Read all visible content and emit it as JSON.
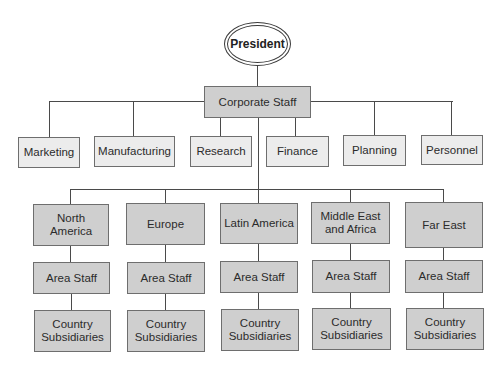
{
  "diagram": {
    "type": "org-chart",
    "root": {
      "label": "President"
    },
    "corporate": {
      "label": "Corporate Staff"
    },
    "functions": [
      {
        "label": "Marketing"
      },
      {
        "label": "Manufacturing"
      },
      {
        "label": "Research"
      },
      {
        "label": "Finance"
      },
      {
        "label": "Planning"
      },
      {
        "label": "Personnel"
      }
    ],
    "regions": [
      {
        "label": "North America",
        "area_staff": "Area Staff",
        "subsidiaries": "Country Subsidiaries"
      },
      {
        "label": "Europe",
        "area_staff": "Area Staff",
        "subsidiaries": "Country Subsidiaries"
      },
      {
        "label": "Latin America",
        "area_staff": "Area Staff",
        "subsidiaries": "Country Subsidiaries"
      },
      {
        "label": "Middle East and Africa",
        "area_staff": "Area Staff",
        "subsidiaries": "Country Subsidiaries"
      },
      {
        "label": "Far East",
        "area_staff": "Area Staff",
        "subsidiaries": "Country Subsidiaries"
      }
    ],
    "colors": {
      "function_fill": "#ececec",
      "region_fill": "#cfcfcf",
      "line": "#4a4a4a"
    }
  }
}
